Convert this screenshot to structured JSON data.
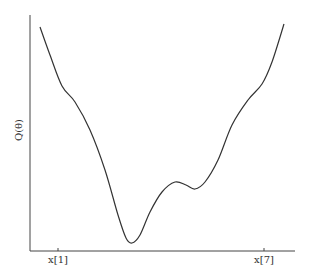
{
  "chart_data": {
    "type": "line",
    "title": "",
    "xlabel": "",
    "ylabel": "Q(θ)",
    "x_tick_labels": [
      "x[1]",
      "x[7]"
    ],
    "y_tick_labels": [],
    "grid": false,
    "legend": null,
    "series": [
      {
        "name": "Q(θ)",
        "description": "Non-convex objective curve with a global minimum and a shallow local minimum",
        "points_px": [
          [
            40,
            27
          ],
          [
            50,
            55
          ],
          [
            62,
            86
          ],
          [
            75,
            102
          ],
          [
            90,
            130
          ],
          [
            105,
            170
          ],
          [
            118,
            215
          ],
          [
            126,
            238
          ],
          [
            132,
            243
          ],
          [
            140,
            235
          ],
          [
            150,
            212
          ],
          [
            162,
            192
          ],
          [
            175,
            182
          ],
          [
            186,
            185
          ],
          [
            195,
            189
          ],
          [
            205,
            182
          ],
          [
            218,
            160
          ],
          [
            232,
            125
          ],
          [
            248,
            100
          ],
          [
            262,
            84
          ],
          [
            272,
            62
          ],
          [
            284,
            24
          ]
        ]
      }
    ],
    "features": {
      "global_minimum": {
        "x_px": 132,
        "y_px": 243
      },
      "local_maximum": {
        "x_px": 175,
        "y_px": 182
      },
      "local_minimum": {
        "x_px": 195,
        "y_px": 189
      }
    }
  },
  "labels": {
    "ylabel": "Q(θ)",
    "xtick1": "x[1]",
    "xtick7": "x[7]"
  }
}
